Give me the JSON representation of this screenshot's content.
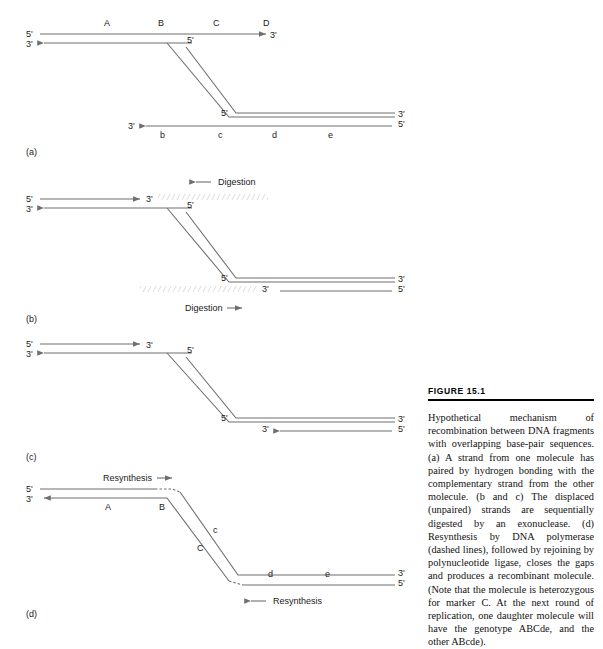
{
  "figure": {
    "label": "FIGURE  15.1",
    "caption": "Hypothetical mechanism of recombination between DNA fragments with overlapping base-pair sequences. (a) A strand from one molecule has paired by hydrogen bonding with the complementary strand from the other molecule. (b and c) The displaced (unpaired) strands are sequentially digested by an exonuclease. (d) Resynthesis by DNA polymerase (dashed lines), followed by rejoining by polynucleotide ligase, closes the gaps and produces a recombinant molecule. (Note that the molecule is heterozygous for marker C. At the next round of replication, one daughter molecule will have the genotype ABCde, and the other ABcde)."
  },
  "ends": {
    "five_prime": "5'",
    "three_prime": "3'"
  },
  "panels": {
    "a": {
      "key": "(a)",
      "markers_upper": [
        "A",
        "B",
        "C",
        "D"
      ],
      "markers_lower": [
        "b",
        "c",
        "d",
        "e"
      ],
      "labels": {
        "top_left_5": "5'",
        "top_left_3": "3'",
        "top_right_3": "3'",
        "junction_upper_5": "5'",
        "junction_lower_5": "5'",
        "bottom_left_3": "3'",
        "bottom_right_3": "3'",
        "bottom_right_5": "5'"
      }
    },
    "b": {
      "key": "(b)",
      "action_top": "Digestion",
      "action_bottom": "Digestion",
      "labels": {
        "top_left_5": "5'",
        "top_left_3": "3'",
        "top_mid_3": "3'",
        "junction_upper_5": "5'",
        "junction_lower_5": "5'",
        "bottom_mid_3": "3'",
        "bottom_right_3": "3'",
        "bottom_right_5": "5'"
      }
    },
    "c": {
      "key": "(c)",
      "labels": {
        "top_left_5": "5'",
        "top_left_3": "3'",
        "top_mid_3": "3'",
        "junction_upper_5": "5'",
        "junction_lower_5": "5'",
        "bottom_mid_3": "3'",
        "bottom_right_3": "3'",
        "bottom_right_5": "5'"
      }
    },
    "d": {
      "key": "(d)",
      "action_top": "Resynthesis",
      "action_bottom": "Resynthesis",
      "markers": [
        "A",
        "B",
        "C",
        "c",
        "d",
        "e"
      ],
      "labels": {
        "top_left_5": "5'",
        "top_left_3": "3'",
        "right_3": "3'",
        "right_5": "5'"
      }
    }
  },
  "colors": {
    "strand": "#6f6f6f",
    "strand_dark": "#4a4a4a",
    "hatch": "#b0b0b0",
    "text": "#1a1a1a",
    "rule": "#000000"
  }
}
